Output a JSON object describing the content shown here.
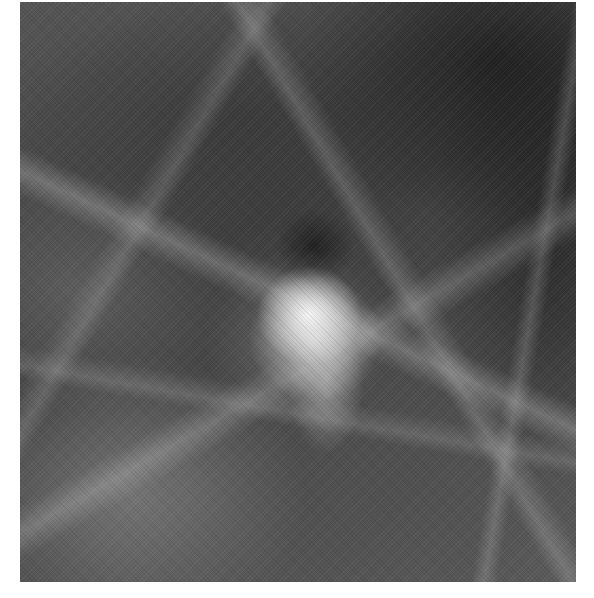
{
  "image": {
    "description": "Grayscale mammography-style radiograph showing fibroglandular tissue with a central bright irregular dense mass and a dark rounded area just above it",
    "colors": {
      "background": "#ffffff",
      "tissue_dark": "#2a2a2a",
      "tissue_mid": "#4a4a4a",
      "mass_bright": "#f0f0f0"
    }
  }
}
